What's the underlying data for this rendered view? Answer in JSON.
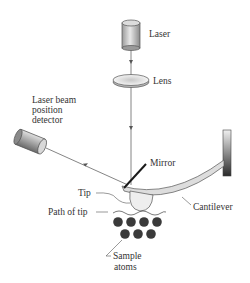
{
  "diagram": {
    "labels": {
      "laser": "Laser",
      "lens": "Lens",
      "detector_line1": "Laser beam",
      "detector_line2": "position",
      "detector_line3": "detector",
      "mirror": "Mirror",
      "tip": "Tip",
      "cantilever": "Cantilever",
      "path_of_tip": "Path of tip",
      "sample_line1": "Sample",
      "sample_line2": "atoms"
    },
    "components": [
      {
        "id": "laser",
        "icon": "cylinder"
      },
      {
        "id": "lens",
        "icon": "ellipse-lens"
      },
      {
        "id": "detector",
        "icon": "cylinder-tilted"
      },
      {
        "id": "mirror",
        "icon": "line"
      },
      {
        "id": "cantilever",
        "icon": "curved-beam"
      },
      {
        "id": "tip",
        "icon": "ellipse"
      },
      {
        "id": "sample-atoms",
        "icon": "dots",
        "count": 7
      }
    ],
    "colors": {
      "beam": "#666666",
      "atom": "#3a3a3a",
      "mirror": "#1a1a1a",
      "text": "#333333"
    }
  }
}
